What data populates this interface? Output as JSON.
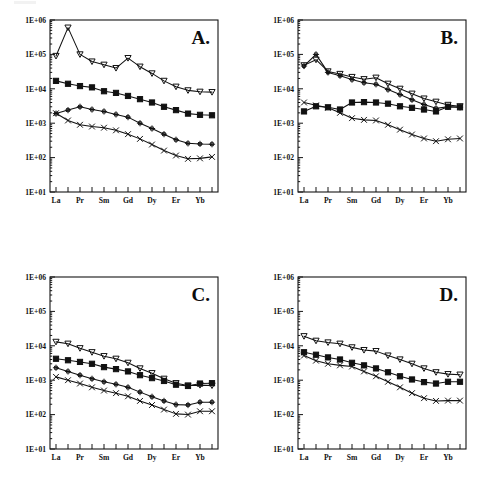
{
  "figure": {
    "panels": [
      "A.",
      "B.",
      "C.",
      "D."
    ],
    "axis": {
      "y_ticks": [
        "1E+01",
        "1E+02",
        "1E+03",
        "1E+04",
        "1E+05",
        "1E+06"
      ],
      "y_min_exp": 1,
      "y_max_exp": 6,
      "x_tick_labels": [
        "La",
        "Pr",
        "Sm",
        "Gd",
        "Dy",
        "Er",
        "Yb"
      ],
      "x_all_elements": [
        "La",
        "Ce",
        "Pr",
        "Nd",
        "Sm",
        "Eu",
        "Gd",
        "Tb",
        "Dy",
        "Ho",
        "Er",
        "Tm",
        "Yb",
        "Lu"
      ],
      "x_labeled_indices": [
        0,
        2,
        4,
        6,
        8,
        10,
        12
      ]
    },
    "colors": {
      "ink": "#111111",
      "frame": "#141414",
      "background": "#ffffff"
    }
  },
  "chart_data": [
    {
      "type": "line",
      "title": "A.",
      "xlabel": "",
      "ylabel": "",
      "ylim": [
        10,
        1000000
      ],
      "yscale": "log",
      "grid": false,
      "legend": "none",
      "categories": [
        "La",
        "Ce",
        "Pr",
        "Nd",
        "Sm",
        "Eu",
        "Gd",
        "Tb",
        "Dy",
        "Ho",
        "Er",
        "Tm",
        "Yb",
        "Lu"
      ],
      "series": [
        {
          "name": "series-1",
          "marker": "triangle-down",
          "values": [
            90000,
            600000,
            100000,
            62000,
            50000,
            40000,
            78000,
            44000,
            28000,
            17000,
            11500,
            9000,
            8200,
            8000
          ]
        },
        {
          "name": "series-2",
          "marker": "filled-square",
          "values": [
            17000,
            14000,
            12000,
            11000,
            8500,
            7600,
            6200,
            5000,
            4000,
            3000,
            2400,
            1900,
            1750,
            1700
          ]
        },
        {
          "name": "series-3",
          "marker": "plus",
          "values": [
            1900,
            2400,
            3000,
            2500,
            2200,
            1800,
            1500,
            1000,
            700,
            480,
            330,
            260,
            250,
            245
          ]
        },
        {
          "name": "series-4",
          "marker": "cross",
          "values": [
            1950,
            1200,
            900,
            800,
            740,
            620,
            480,
            350,
            240,
            160,
            115,
            92,
            95,
            105
          ]
        }
      ]
    },
    {
      "type": "line",
      "title": "B.",
      "xlabel": "",
      "ylabel": "",
      "ylim": [
        10,
        1000000
      ],
      "yscale": "log",
      "grid": false,
      "legend": "none",
      "categories": [
        "La",
        "Ce",
        "Pr",
        "Nd",
        "Sm",
        "Eu",
        "Gd",
        "Tb",
        "Dy",
        "Ho",
        "Er",
        "Tm",
        "Yb",
        "Lu"
      ],
      "series": [
        {
          "name": "series-1",
          "marker": "triangle-down",
          "values": [
            48000,
            70000,
            32000,
            27000,
            22000,
            19000,
            21000,
            14000,
            10000,
            7200,
            5200,
            4200,
            3400,
            3100
          ]
        },
        {
          "name": "series-2",
          "marker": "plus",
          "values": [
            46000,
            100000,
            30000,
            24000,
            18500,
            15000,
            13500,
            9500,
            6800,
            4800,
            3500,
            2700,
            3000,
            2900
          ]
        },
        {
          "name": "series-3",
          "marker": "filled-square",
          "values": [
            2200,
            3100,
            2900,
            2500,
            4000,
            4100,
            4000,
            3700,
            3100,
            2800,
            2500,
            2200,
            3000,
            2900
          ]
        },
        {
          "name": "series-4",
          "marker": "cross",
          "values": [
            4000,
            3300,
            2800,
            2000,
            1400,
            1250,
            1200,
            900,
            650,
            470,
            360,
            300,
            340,
            360
          ]
        }
      ]
    },
    {
      "type": "line",
      "title": "C.",
      "xlabel": "",
      "ylabel": "",
      "ylim": [
        10,
        1000000
      ],
      "yscale": "log",
      "grid": false,
      "legend": "none",
      "categories": [
        "La",
        "Ce",
        "Pr",
        "Nd",
        "Sm",
        "Eu",
        "Gd",
        "Tb",
        "Dy",
        "Ho",
        "Er",
        "Tm",
        "Yb",
        "Lu"
      ],
      "series": [
        {
          "name": "series-1",
          "marker": "triangle-down",
          "values": [
            13000,
            11500,
            8500,
            6500,
            5000,
            4200,
            3200,
            2200,
            1600,
            1100,
            820,
            700,
            720,
            700
          ]
        },
        {
          "name": "series-2",
          "marker": "filled-square",
          "values": [
            4200,
            3800,
            3400,
            3000,
            2400,
            2100,
            1800,
            1400,
            1150,
            950,
            740,
            680,
            800,
            820
          ]
        },
        {
          "name": "series-3",
          "marker": "plus",
          "values": [
            2300,
            1800,
            1400,
            1100,
            900,
            760,
            620,
            450,
            330,
            250,
            195,
            190,
            230,
            230
          ]
        },
        {
          "name": "series-4",
          "marker": "cross",
          "values": [
            1250,
            1000,
            800,
            620,
            500,
            420,
            340,
            250,
            190,
            140,
            105,
            100,
            125,
            125
          ]
        }
      ]
    },
    {
      "type": "line",
      "title": "D.",
      "xlabel": "",
      "ylabel": "",
      "ylim": [
        10,
        1000000
      ],
      "yscale": "log",
      "grid": false,
      "legend": "none",
      "categories": [
        "La",
        "Ce",
        "Pr",
        "Nd",
        "Sm",
        "Eu",
        "Gd",
        "Tb",
        "Dy",
        "Ho",
        "Er",
        "Tm",
        "Yb",
        "Lu"
      ],
      "series": [
        {
          "name": "series-1",
          "marker": "triangle-down",
          "values": [
            19000,
            14000,
            12500,
            11500,
            9000,
            7500,
            7000,
            5200,
            4000,
            3000,
            2200,
            1700,
            1500,
            1450
          ]
        },
        {
          "name": "series-2",
          "marker": "filled-square",
          "values": [
            6500,
            5500,
            4600,
            4000,
            3200,
            2700,
            2200,
            1700,
            1300,
            1050,
            880,
            800,
            900,
            900
          ]
        },
        {
          "name": "series-3",
          "marker": "cross",
          "values": [
            5200,
            3700,
            3000,
            2700,
            2500,
            1800,
            1300,
            900,
            620,
            420,
            300,
            250,
            255,
            255
          ]
        }
      ]
    }
  ]
}
